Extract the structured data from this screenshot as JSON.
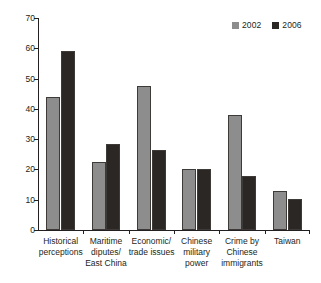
{
  "chart_data": {
    "type": "bar",
    "title": "",
    "xlabel": "",
    "ylabel": "",
    "ylim": [
      0,
      70
    ],
    "yticks": [
      0,
      10,
      20,
      30,
      40,
      50,
      60,
      70
    ],
    "grid": false,
    "legend_position": "top-right",
    "categories": [
      "Historical perceptions",
      "Maritime diputes/ East China",
      "Economic/ trade issues",
      "Chinese military power",
      "Crime by Chinese immigrants",
      "Taiwan"
    ],
    "category_lines": [
      [
        "Historical",
        "perceptions"
      ],
      [
        "Maritime",
        "diputes/",
        "East China"
      ],
      [
        "Economic/",
        "trade issues"
      ],
      [
        "Chinese",
        "military",
        "power"
      ],
      [
        "Crime by",
        "Chinese",
        "immigrants"
      ],
      [
        "Taiwan"
      ]
    ],
    "series": [
      {
        "name": "2002",
        "color": "#8d8d8d",
        "values": [
          44,
          22.3,
          47.4,
          20.1,
          38.1,
          13
        ]
      },
      {
        "name": "2006",
        "color": "#2b2725",
        "values": [
          59,
          28.5,
          26.4,
          20.3,
          18,
          10.3
        ]
      }
    ]
  },
  "legend": {
    "entries": [
      {
        "label": "2002",
        "color": "#8d8d8d"
      },
      {
        "label": "2006",
        "color": "#2b2725"
      }
    ]
  },
  "axis": {
    "y_tick_labels": [
      "0",
      "10",
      "20",
      "30",
      "40",
      "50",
      "60",
      "70"
    ]
  }
}
